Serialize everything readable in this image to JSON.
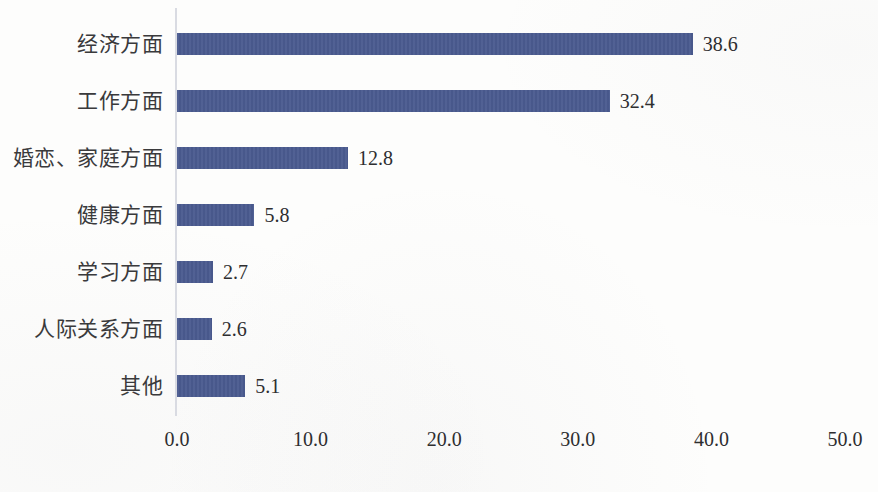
{
  "chart_data": {
    "type": "bar",
    "orientation": "horizontal",
    "title": "",
    "subtitle": "",
    "xlabel": "",
    "ylabel": "",
    "categories": [
      "经济方面",
      "工作方面",
      "婚恋、家庭方面",
      "健康方面",
      "学习方面",
      "人际关系方面",
      "其他"
    ],
    "values": [
      38.6,
      32.4,
      12.8,
      5.8,
      2.7,
      2.6,
      5.1
    ],
    "value_labels": [
      "38.6",
      "32.4",
      "12.8",
      "5.8",
      "2.7",
      "2.6",
      "5.1"
    ],
    "xlim": [
      0.0,
      50.0
    ],
    "xticks": [
      0.0,
      10.0,
      20.0,
      30.0,
      40.0,
      50.0
    ],
    "xtick_labels": [
      "0.0",
      "10.0",
      "20.0",
      "30.0",
      "40.0",
      "50.0"
    ],
    "grid": false,
    "legend": null,
    "series": [
      {
        "name": "",
        "values": [
          38.6,
          32.4,
          12.8,
          5.8,
          2.7,
          2.6,
          5.1
        ]
      }
    ],
    "colors": {
      "bar": "#4a5a8f",
      "axis_line": "#d9dbe2",
      "text": "#2e2e30",
      "category_text": "#3a3a3c",
      "background": "#fdfdfc"
    }
  }
}
